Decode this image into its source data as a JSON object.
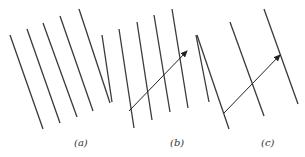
{
  "figure": {
    "line_color": "#3a3a3a",
    "panels": [
      {
        "id": "a",
        "label": "(a)",
        "label_pos": [
          74,
          137
        ],
        "lines": [
          [
            10,
            35,
            43,
            129
          ],
          [
            27,
            29,
            60,
            123
          ],
          [
            43,
            23,
            77,
            117
          ],
          [
            60,
            16,
            93,
            111
          ],
          [
            79,
            9,
            110,
            103
          ]
        ],
        "arrow": null
      },
      {
        "id": "b",
        "label": "(b)",
        "label_pos": [
          170,
          137
        ],
        "lines": [
          [
            102,
            35,
            112,
            102
          ],
          [
            119,
            29,
            134,
            128
          ],
          [
            137,
            22,
            152,
            120
          ],
          [
            154,
            15,
            170,
            112
          ],
          [
            172,
            9,
            188,
            108
          ],
          [
            196,
            35,
            209,
            102
          ]
        ],
        "arrow": [
          129,
          111,
          187,
          51
        ]
      },
      {
        "id": "c",
        "label": "(c)",
        "label_pos": [
          261,
          137
        ],
        "lines": [
          [
            197,
            35,
            229,
            129
          ],
          [
            230,
            22,
            264,
            116
          ],
          [
            264,
            9,
            298,
            104
          ]
        ],
        "arrow": [
          224,
          113,
          280,
          55
        ]
      }
    ]
  }
}
